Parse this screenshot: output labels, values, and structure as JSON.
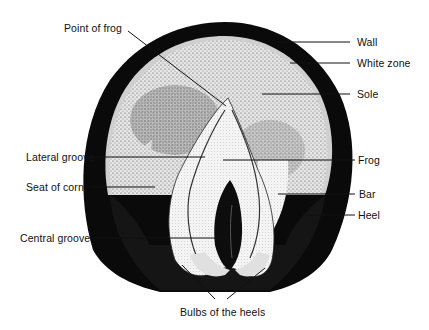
{
  "diagram": {
    "colors": {
      "ink": "#111111",
      "paper": "#ffffff",
      "wall": "#0a0a0a",
      "sole": "#d9d9d9",
      "frog": "#f2f2f2"
    },
    "labels": {
      "point_of_frog": "Point of frog",
      "wall": "Wall",
      "white_zone": "White zone",
      "sole": "Sole",
      "lateral_groove": "Lateral groove",
      "frog": "Frog",
      "seat_of_corn": "Seat of corn",
      "bar": "Bar",
      "heel": "Heel",
      "central_groove": "Central groove",
      "bulbs_of_the_heels": "Bulbs of the heels"
    }
  }
}
